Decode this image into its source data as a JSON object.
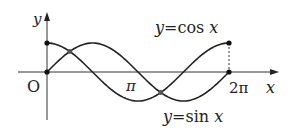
{
  "chart_data": {
    "type": "line",
    "title": "",
    "xlabel": "x",
    "ylabel": "y",
    "origin_label": "O",
    "x_ticks": [
      {
        "value": 3.14159,
        "label": "π"
      },
      {
        "value": 6.28319,
        "label": "2π"
      }
    ],
    "xlim": [
      -0.9,
      7.8
    ],
    "ylim": [
      -1.5,
      2.0
    ],
    "grid": false,
    "legend": "inline annotations",
    "series": [
      {
        "name": "y=cos x",
        "function": "cos",
        "x_range": [
          0,
          6.28319
        ],
        "endpoints": [
          [
            0,
            1
          ],
          [
            6.28319,
            1
          ]
        ]
      },
      {
        "name": "y=sin x",
        "function": "sin",
        "x_range": [
          0,
          6.28319
        ],
        "endpoints": [
          [
            0,
            0
          ],
          [
            6.28319,
            0
          ]
        ]
      }
    ],
    "intersections": [
      [
        0.7854,
        0.7071
      ],
      [
        3.927,
        -0.7071
      ]
    ],
    "annotations": [
      "dashed vertical line at x=2π from y=0 to y=1"
    ]
  },
  "labels": {
    "y_axis": "y",
    "x_axis": "x",
    "origin": "O",
    "pi": "π",
    "two_pi": "2π",
    "cos_y": "y",
    "cos_rest": "=cos ",
    "cos_x": "x",
    "sin_y": "y",
    "sin_rest": "=sin ",
    "sin_x": "x"
  }
}
